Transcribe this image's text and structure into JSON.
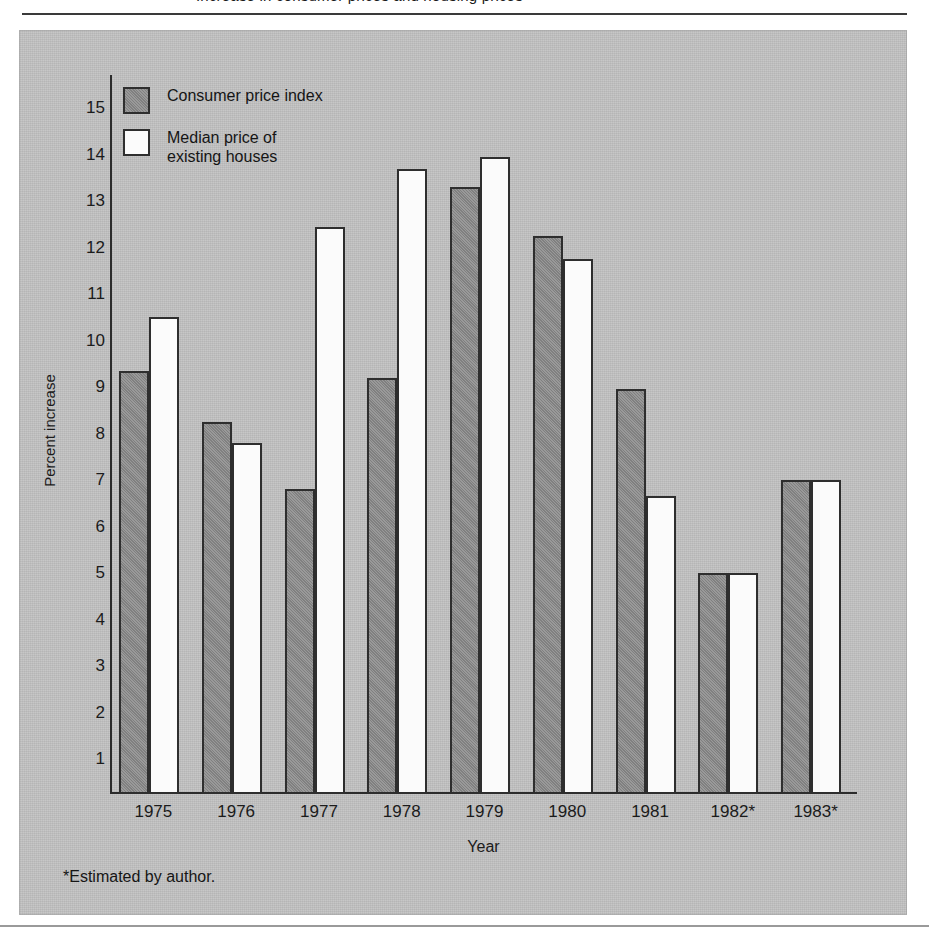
{
  "figure": {
    "clipped_title": "Increase in consumer prices and housing prices",
    "footnote": "*Estimated by author.",
    "panel_color": "#c2c2c2",
    "bar_outline_color": "#2e2e2e"
  },
  "legend": {
    "position": "top-left",
    "entries": [
      {
        "label": "Consumer price index",
        "swatch": "cpi",
        "color": "#8e8e8e"
      },
      {
        "label": "Median price of\nexisting houses",
        "swatch": "median",
        "color": "#fbfbfb"
      }
    ]
  },
  "chart_data": {
    "type": "bar",
    "title": "",
    "xlabel": "Year",
    "ylabel": "Percent increase",
    "categories": [
      "1975",
      "1976",
      "1977",
      "1978",
      "1979",
      "1980",
      "1981",
      "1982*",
      "1983*"
    ],
    "yticks": [
      1,
      2,
      3,
      4,
      5,
      6,
      7,
      8,
      9,
      10,
      11,
      12,
      13,
      14,
      15
    ],
    "ylim": [
      0,
      15.6
    ],
    "grid": false,
    "legend_position": "upper-left",
    "annotations": [
      "*Estimated by author."
    ],
    "series": [
      {
        "name": "Consumer price index",
        "color": "#8e8e8e",
        "values": [
          9.35,
          8.25,
          6.8,
          9.2,
          13.3,
          12.25,
          8.95,
          5.0,
          7.0
        ]
      },
      {
        "name": "Median price of existing houses",
        "color": "#fbfbfb",
        "values": [
          10.5,
          7.8,
          12.45,
          13.7,
          13.95,
          11.75,
          6.65,
          5.0,
          7.0
        ]
      }
    ]
  }
}
